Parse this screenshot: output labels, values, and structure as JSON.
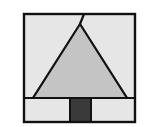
{
  "figure": {
    "colors": {
      "background": "#ffffff",
      "frame_fill": "#e6e6e6",
      "triangle_fill": "#c4c4c4",
      "trunk_fill": "#3a3a3a",
      "stroke": "#111111"
    },
    "shapes": {
      "frame": {
        "x": 24,
        "y": 14,
        "width": 111,
        "height": 108
      },
      "divider": {
        "x1": 24,
        "y1": 98,
        "x2": 135,
        "y2": 98
      },
      "triangle": {
        "points": [
          [
            80,
            24
          ],
          [
            33,
            98
          ],
          [
            127,
            98
          ]
        ]
      },
      "apex_stub": {
        "x1": 80,
        "y1": 24,
        "x2": 84,
        "y2": 14
      },
      "trunk": {
        "x": 70,
        "y": 98,
        "width": 21,
        "height": 24
      }
    }
  }
}
